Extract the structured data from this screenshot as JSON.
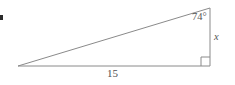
{
  "figure": {
    "kind": "right-triangle-diagram",
    "background_color": "#ffffff",
    "stroke_color": "#8a8a8a",
    "text_color": "#555555",
    "canvas": {
      "width": 235,
      "height": 85
    },
    "vertices": {
      "left": {
        "x": 18,
        "y": 66
      },
      "bottom_right": {
        "x": 210,
        "y": 66
      },
      "top_right": {
        "x": 210,
        "y": 8
      }
    },
    "labels": {
      "angle": "74°",
      "angle_value": 74,
      "angle_unit": "degrees",
      "vertical_side": "x",
      "base_side": "15",
      "base_value": 15
    },
    "right_angle_marker": {
      "present": true,
      "at_vertex": "bottom_right",
      "size": 9
    }
  },
  "chart_data": {
    "type": "diagram",
    "title": "",
    "shape": "right triangle",
    "points": [
      {
        "name": "A",
        "x": 18,
        "y": 66,
        "role": "acute-vertex-left"
      },
      {
        "name": "B",
        "x": 210,
        "y": 66,
        "role": "right-angle-vertex"
      },
      {
        "name": "C",
        "x": 210,
        "y": 8,
        "role": "labeled-angle-vertex"
      }
    ],
    "edges": [
      {
        "from": "A",
        "to": "B",
        "label": "15",
        "name": "base"
      },
      {
        "from": "B",
        "to": "C",
        "label": "x",
        "name": "vertical-leg"
      },
      {
        "from": "A",
        "to": "C",
        "label": "",
        "name": "hypotenuse"
      }
    ],
    "annotations": [
      {
        "text": "74°",
        "at": "C",
        "kind": "interior-angle"
      },
      {
        "text": "x",
        "at": "BC",
        "kind": "side-length-unknown"
      },
      {
        "text": "15",
        "at": "AB",
        "kind": "side-length"
      },
      {
        "text": "right angle",
        "at": "B",
        "kind": "right-angle-marker"
      }
    ]
  }
}
